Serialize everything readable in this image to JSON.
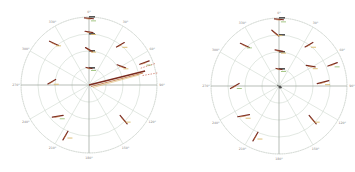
{
  "chart_data": [
    {
      "type": "scatter",
      "subtype": "polar",
      "title": "",
      "center": [
        89,
        85
      ],
      "radius": 68,
      "angle_ticks": [
        "0°",
        "30°",
        "60°",
        "90°",
        "120°",
        "150°",
        "180°",
        "210°",
        "240°",
        "270°",
        "300°",
        "330°"
      ],
      "angle_direction": "clockwise_from_top",
      "radial_ticks": [
        "",
        "",
        "",
        ""
      ],
      "radial_rings": 4,
      "grid": true,
      "colors": {
        "grid": "#cfd8cf",
        "axis": "#9aa09a",
        "track_dark": "#7a2a1e",
        "track_mid": "#c0703a",
        "track_light": "#d8b86a",
        "track_green": "#9cc27a"
      },
      "series": [
        {
          "name": "tracks",
          "points_polar": [
            {
              "theta": 0,
              "r": 0.25,
              "len": 6,
              "heading": 100
            },
            {
              "theta": 0,
              "r": 0.52,
              "len": 8,
              "heading": 120
            },
            {
              "theta": 0,
              "r": 0.78,
              "len": 8,
              "heading": 100
            },
            {
              "theta": 0,
              "r": 0.98,
              "len": 9,
              "heading": 95
            },
            {
              "theta": 38,
              "r": 0.75,
              "len": 9,
              "heading": 60
            },
            {
              "theta": 60,
              "r": 0.55,
              "len": 9,
              "heading": 110
            },
            {
              "theta": 68,
              "r": 0.88,
              "len": 10,
              "heading": 70
            },
            {
              "theta": -40,
              "r": 0.8,
              "len": 10,
              "heading": 115
            },
            {
              "theta": -85,
              "r": 0.55,
              "len": 9,
              "heading": 60
            },
            {
              "theta": -135,
              "r": 0.65,
              "len": 11,
              "heading": 80
            },
            {
              "theta": -155,
              "r": 0.82,
              "len": 10,
              "heading": 30
            },
            {
              "theta": 135,
              "r": 0.72,
              "len": 11,
              "heading": 140
            }
          ]
        },
        {
          "name": "radial-streak",
          "theta_deg": 76,
          "r_range": [
            0,
            1.0
          ],
          "dashed_extensions": [
            72,
            80
          ]
        }
      ]
    },
    {
      "type": "scatter",
      "subtype": "polar",
      "title": "",
      "center": [
        102,
        86
      ],
      "radius": 68,
      "angle_ticks": [
        "0°",
        "30°",
        "60°",
        "90°",
        "120°",
        "150°",
        "180°",
        "210°",
        "240°",
        "270°",
        "300°",
        "330°"
      ],
      "angle_direction": "clockwise_from_top",
      "radial_ticks": [
        "",
        "",
        "",
        ""
      ],
      "radial_rings": 4,
      "grid": true,
      "series": [
        {
          "name": "tracks",
          "points_polar": [
            {
              "theta": 0,
              "r": 0.25,
              "len": 6,
              "heading": 100
            },
            {
              "theta": 0,
              "r": 0.52,
              "len": 8,
              "heading": 100
            },
            {
              "theta": -4,
              "r": 0.78,
              "len": 9,
              "heading": 130
            },
            {
              "theta": 0,
              "r": 0.98,
              "len": 9,
              "heading": 95
            },
            {
              "theta": 36,
              "r": 0.75,
              "len": 9,
              "heading": 60
            },
            {
              "theta": 58,
              "r": 0.55,
              "len": 9,
              "heading": 100
            },
            {
              "theta": 68,
              "r": 0.85,
              "len": 10,
              "heading": 70
            },
            {
              "theta": 85,
              "r": 0.65,
              "len": 12,
              "heading": 75
            },
            {
              "theta": 135,
              "r": 0.7,
              "len": 11,
              "heading": 140
            },
            {
              "theta": -90,
              "r": 0.65,
              "len": 10,
              "heading": 60
            },
            {
              "theta": -130,
              "r": 0.68,
              "len": 12,
              "heading": 80
            },
            {
              "theta": -155,
              "r": 0.82,
              "len": 10,
              "heading": 30
            },
            {
              "theta": -40,
              "r": 0.78,
              "len": 10,
              "heading": 115
            }
          ]
        },
        {
          "name": "center-cluster",
          "theta_deg": 0,
          "r": 0.02
        }
      ]
    }
  ]
}
